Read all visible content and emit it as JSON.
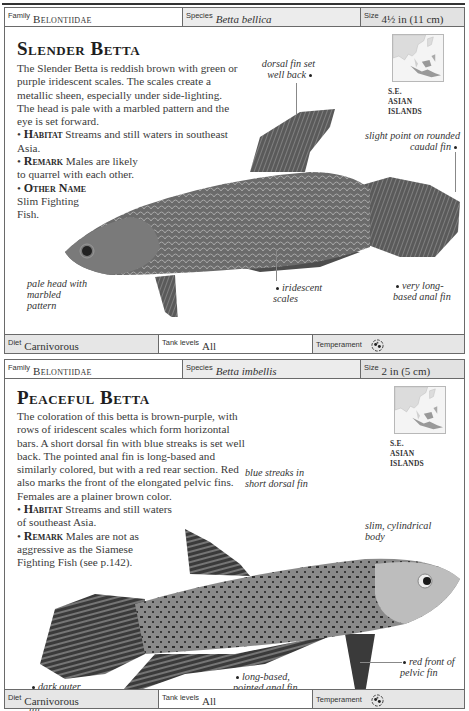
{
  "entries": [
    {
      "header": {
        "family_label": "Family",
        "family_value": "Belontiidae",
        "species_label": "Species",
        "species_value": "Betta bellica",
        "size_label": "Size",
        "size_value": "4½ in (11 cm)"
      },
      "title": "Slender Betta",
      "description": "The Slender Betta is reddish brown with green or purple iridescent scales. The scales create a metallic sheen, especially under side-lighting. The head is pale with a marbled pattern and the eye is set forward.",
      "bullets": [
        {
          "label": "Habitat",
          "text": "Streams and still waters in southeast Asia."
        },
        {
          "label": "Remark",
          "text": "Males are likely to quarrel with each other."
        },
        {
          "label": "Other Name",
          "text": "Slim Fighting Fish."
        }
      ],
      "map": {
        "label_line1": "S.E. ASIAN",
        "label_line2": "ISLANDS",
        "icon": "map-se-asia-icon"
      },
      "callouts": [
        {
          "id": "dorsal",
          "text": "dorsal fin set well back"
        },
        {
          "id": "caudal",
          "text": "slight point on rounded caudal fin"
        },
        {
          "id": "head",
          "text": "pale head with marbled pattern"
        },
        {
          "id": "scales",
          "text": "iridescent scales"
        },
        {
          "id": "anal",
          "text": "very long-based anal fin"
        }
      ],
      "footer": {
        "diet_label": "Diet",
        "diet_value": "Carnivorous",
        "tank_label": "Tank levels",
        "tank_value": "All",
        "temperament_label": "Temperament",
        "temperament_icon": "peaceful-fish-icon"
      }
    },
    {
      "header": {
        "family_label": "Family",
        "family_value": "Belontiidae",
        "species_label": "Species",
        "species_value": "Betta imbellis",
        "size_label": "Size",
        "size_value": "2 in (5 cm)"
      },
      "title": "Peaceful Betta",
      "description": "The coloration of this betta is brown-purple, with rows of iridescent scales which form horizontal bars. A short dorsal fin with blue streaks is set well back. The pointed anal fin is long-based and similarly colored, but with a red rear section. Red also marks the front of the elongated pelvic fins. Females are a plainer brown color.",
      "bullets": [
        {
          "label": "Habitat",
          "text": "Streams and still waters of southeast Asia."
        },
        {
          "label": "Remark",
          "text": "Males are not as aggressive as the Siamese Fighting Fish (see p.142)."
        }
      ],
      "map": {
        "label_line1": "S.E. ASIAN",
        "label_line2": "ISLANDS",
        "icon": "map-se-asia-icon"
      },
      "callouts": [
        {
          "id": "dorsal",
          "text": "blue streaks in short dorsal fin"
        },
        {
          "id": "body",
          "text": "slim, cylindrical body"
        },
        {
          "id": "pelvic",
          "text": "red front of pelvic fin"
        },
        {
          "id": "anal",
          "text": "long-based, pointed anal fin"
        },
        {
          "id": "caudal",
          "text": "dark outer rim of caudal fin"
        }
      ],
      "footer": {
        "diet_label": "Diet",
        "diet_value": "Carnivorous",
        "tank_label": "Tank levels",
        "tank_value": "All",
        "temperament_label": "Temperament",
        "temperament_icon": "peaceful-fish-icon"
      }
    }
  ]
}
